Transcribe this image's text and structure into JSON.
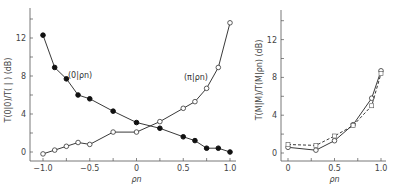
{
  "chart_data": [
    {
      "type": "line",
      "title": "",
      "xlabel": "ρn",
      "ylabel": "T(0|0)/T( | )   (dB)",
      "xlim": [
        -1.0,
        1.0
      ],
      "ylim": [
        -1,
        15
      ],
      "xticks": [
        "-1.0",
        "-0.5",
        "0",
        "0.5",
        "1.0"
      ],
      "yticks": [
        "0",
        "4",
        "8",
        "12"
      ],
      "grid": false,
      "series": [
        {
          "name": "(0|ρn)",
          "marker": "filled-circle",
          "x": [
            -1.0,
            -0.875,
            -0.75,
            -0.625,
            -0.5,
            -0.25,
            0.0,
            0.25,
            0.5,
            0.625,
            0.75,
            0.875,
            1.0
          ],
          "y": [
            12.3,
            8.9,
            7.7,
            6.0,
            5.6,
            4.3,
            3.1,
            2.5,
            1.6,
            1.2,
            0.4,
            0.4,
            0.0
          ]
        },
        {
          "name": "(π|ρn)",
          "marker": "open-circle",
          "x": [
            -1.0,
            -0.875,
            -0.75,
            -0.625,
            -0.5,
            -0.25,
            0.0,
            0.25,
            0.5,
            0.625,
            0.75,
            0.875,
            1.0
          ],
          "y": [
            -0.2,
            0.2,
            0.6,
            1.0,
            0.8,
            2.1,
            2.1,
            3.2,
            4.6,
            5.3,
            6.7,
            8.9,
            13.6
          ]
        }
      ],
      "annotations": [
        "(0|ρn)",
        "(π|ρn)"
      ]
    },
    {
      "type": "line",
      "title": "",
      "xlabel": "ρn",
      "ylabel": "T(M|M)/T(M|ρn)   (dB)",
      "xlim": [
        0,
        1.0
      ],
      "ylim": [
        -1,
        15
      ],
      "xticks": [
        "0",
        "0.5",
        "1.0"
      ],
      "yticks": [
        "0",
        "4",
        "8",
        "12"
      ],
      "grid": false,
      "series": [
        {
          "name": "solid",
          "style": "solid",
          "marker": "open-circle",
          "x": [
            0,
            0.3,
            0.5,
            0.7,
            0.9,
            1.0
          ],
          "y": [
            0.6,
            0.3,
            1.3,
            3.0,
            5.8,
            8.7
          ]
        },
        {
          "name": "dashed",
          "style": "dashed",
          "marker": "open-square",
          "x": [
            0,
            0.3,
            0.5,
            0.7,
            0.9,
            1.0
          ],
          "y": [
            0.9,
            0.8,
            1.8,
            2.9,
            5.0,
            8.4
          ]
        }
      ]
    }
  ],
  "left": {
    "ylabel": "T(0|0)/T( | )",
    "yunit": "(dB)",
    "xlabel": "ρn",
    "label_zero": "(0|ρn)",
    "label_pi": "(π|ρn)"
  },
  "right": {
    "ylabel": "T(M|M)/T(M|ρn)",
    "yunit": "(dB)",
    "xlabel": "ρn"
  }
}
